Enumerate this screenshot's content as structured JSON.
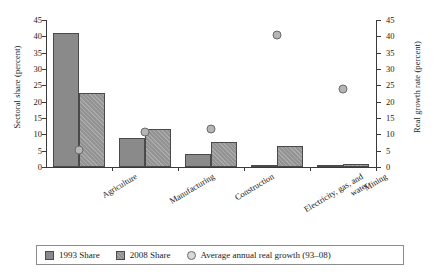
{
  "chart_data": {
    "type": "bar",
    "title": "",
    "xlabel": "",
    "ylabel": "Sectoral share (percent)",
    "y2label": "Real growth rate (percent)",
    "ylim": [
      0,
      45
    ],
    "y2lim": [
      0,
      45
    ],
    "yticks": [
      "0",
      "5",
      "10",
      "15",
      "20",
      "25",
      "30",
      "35",
      "40",
      "45"
    ],
    "y2ticks": [
      "0",
      "5",
      "10",
      "15",
      "20",
      "25",
      "30",
      "35",
      "40",
      "45"
    ],
    "grid": false,
    "legend_position": "bottom",
    "categories": [
      "Agriculture",
      "Manufacturing",
      "Construction",
      "Electricity, gas, and\nwater",
      "Mining"
    ],
    "series": [
      {
        "name": "1993 Share",
        "axis": "left",
        "type": "bar",
        "values": [
          41.1,
          9.0,
          3.9,
          0.4,
          0.2
        ]
      },
      {
        "name": "2008 Share",
        "axis": "left",
        "type": "bar",
        "values": [
          22.7,
          11.7,
          7.8,
          6.3,
          1.0
        ]
      },
      {
        "name": "Average annual real growth (93–08)",
        "axis": "right",
        "type": "scatter",
        "values": [
          6.5,
          12.2,
          13.1,
          41.7,
          25.3
        ]
      }
    ],
    "colors": {
      "series_1993": "#8a8a8a",
      "series_2008": "#939393",
      "marker": "#b5b5b5",
      "axis": "#3a3a3a",
      "text": "#1a1a1a",
      "background": "#ffffff"
    }
  },
  "legend": {
    "items": [
      {
        "label": "1993 Share"
      },
      {
        "label": "2008 Share"
      },
      {
        "label": "Average annual real growth (93–08)"
      }
    ]
  }
}
